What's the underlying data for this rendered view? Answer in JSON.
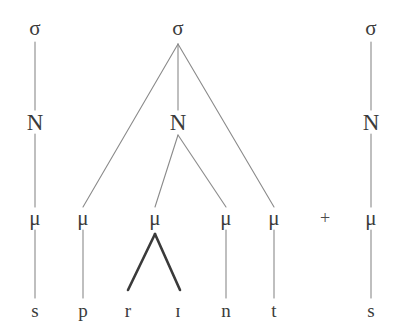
{
  "diagram": {
    "type": "prosodic-syllable-tree",
    "word": "sprint s",
    "canvas": {
      "width": 406,
      "height": 333,
      "background": "#ffffff"
    },
    "colors": {
      "text": "#3b3b3b",
      "thin_line": "#8a8a8a",
      "bold_line": "#3a3a3a"
    },
    "rows": {
      "sigma_y": 28,
      "nucleus_y": 122,
      "mora_y": 218,
      "segment_y": 310
    },
    "labels": {
      "sigma": "σ",
      "nucleus": "N",
      "mora": "μ",
      "plus": "+"
    },
    "nodes": {
      "sigmas": [
        {
          "id": "sigma-left",
          "label": "σ",
          "x": 35,
          "y": 28
        },
        {
          "id": "sigma-center",
          "label": "σ",
          "x": 178,
          "y": 28
        },
        {
          "id": "sigma-right",
          "label": "σ",
          "x": 371,
          "y": 28
        }
      ],
      "nuclei": [
        {
          "id": "nucleus-left",
          "label": "N",
          "x": 35,
          "y": 122
        },
        {
          "id": "nucleus-center",
          "label": "N",
          "x": 178,
          "y": 122
        },
        {
          "id": "nucleus-right",
          "label": "N",
          "x": 371,
          "y": 122
        }
      ],
      "morae": [
        {
          "id": "mora-1",
          "label": "μ",
          "x": 35,
          "y": 218
        },
        {
          "id": "mora-2",
          "label": "μ",
          "x": 83,
          "y": 218
        },
        {
          "id": "mora-3",
          "label": "μ",
          "x": 155,
          "y": 218
        },
        {
          "id": "mora-4",
          "label": "μ",
          "x": 226,
          "y": 218
        },
        {
          "id": "mora-5",
          "label": "μ",
          "x": 274,
          "y": 218
        },
        {
          "id": "mora-6",
          "label": "μ",
          "x": 371,
          "y": 218
        }
      ],
      "segments": [
        {
          "id": "segment-s1",
          "label": "s",
          "x": 35,
          "y": 310
        },
        {
          "id": "segment-p",
          "label": "p",
          "x": 83,
          "y": 310
        },
        {
          "id": "segment-r",
          "label": "r",
          "x": 128,
          "y": 310
        },
        {
          "id": "segment-i",
          "label": "ɪ",
          "x": 178,
          "y": 310
        },
        {
          "id": "segment-n",
          "label": "n",
          "x": 226,
          "y": 310
        },
        {
          "id": "segment-t",
          "label": "t",
          "x": 274,
          "y": 310
        },
        {
          "id": "segment-s2",
          "label": "s",
          "x": 371,
          "y": 310
        }
      ],
      "operators": [
        {
          "id": "plus-operator",
          "label": "+",
          "x": 325,
          "y": 218
        }
      ]
    },
    "edges": {
      "thin": [
        {
          "id": "edge-sigmaL-nucleusL",
          "x1": 35,
          "y1": 42,
          "x2": 35,
          "y2": 110
        },
        {
          "id": "edge-nucleusL-mora1",
          "x1": 35,
          "y1": 134,
          "x2": 35,
          "y2": 207
        },
        {
          "id": "edge-mora1-s1",
          "x1": 35,
          "y1": 230,
          "x2": 35,
          "y2": 298
        },
        {
          "id": "edge-sigmaC-mora2",
          "x1": 178,
          "y1": 44,
          "x2": 83,
          "y2": 207
        },
        {
          "id": "edge-sigmaC-nucleusC",
          "x1": 178,
          "y1": 44,
          "x2": 178,
          "y2": 110
        },
        {
          "id": "edge-sigmaC-mora5",
          "x1": 178,
          "y1": 44,
          "x2": 274,
          "y2": 207
        },
        {
          "id": "edge-nucleusC-mora3",
          "x1": 178,
          "y1": 135,
          "x2": 155,
          "y2": 207
        },
        {
          "id": "edge-nucleusC-mora4",
          "x1": 178,
          "y1": 135,
          "x2": 226,
          "y2": 207
        },
        {
          "id": "edge-mora2-p",
          "x1": 83,
          "y1": 230,
          "x2": 83,
          "y2": 298
        },
        {
          "id": "edge-mora4-n",
          "x1": 226,
          "y1": 230,
          "x2": 226,
          "y2": 298
        },
        {
          "id": "edge-mora5-t",
          "x1": 274,
          "y1": 230,
          "x2": 274,
          "y2": 298
        },
        {
          "id": "edge-sigmaR-nucleusR",
          "x1": 371,
          "y1": 42,
          "x2": 371,
          "y2": 110
        },
        {
          "id": "edge-nucleusR-mora6",
          "x1": 371,
          "y1": 134,
          "x2": 371,
          "y2": 207
        },
        {
          "id": "edge-mora6-s2",
          "x1": 371,
          "y1": 230,
          "x2": 371,
          "y2": 298
        }
      ],
      "bold": [
        {
          "id": "edge-mora3-r-bold",
          "x1": 155,
          "y1": 234,
          "x2": 128,
          "y2": 290
        },
        {
          "id": "edge-mora3-i-bold",
          "x1": 155,
          "y1": 234,
          "x2": 180,
          "y2": 290
        }
      ]
    }
  }
}
